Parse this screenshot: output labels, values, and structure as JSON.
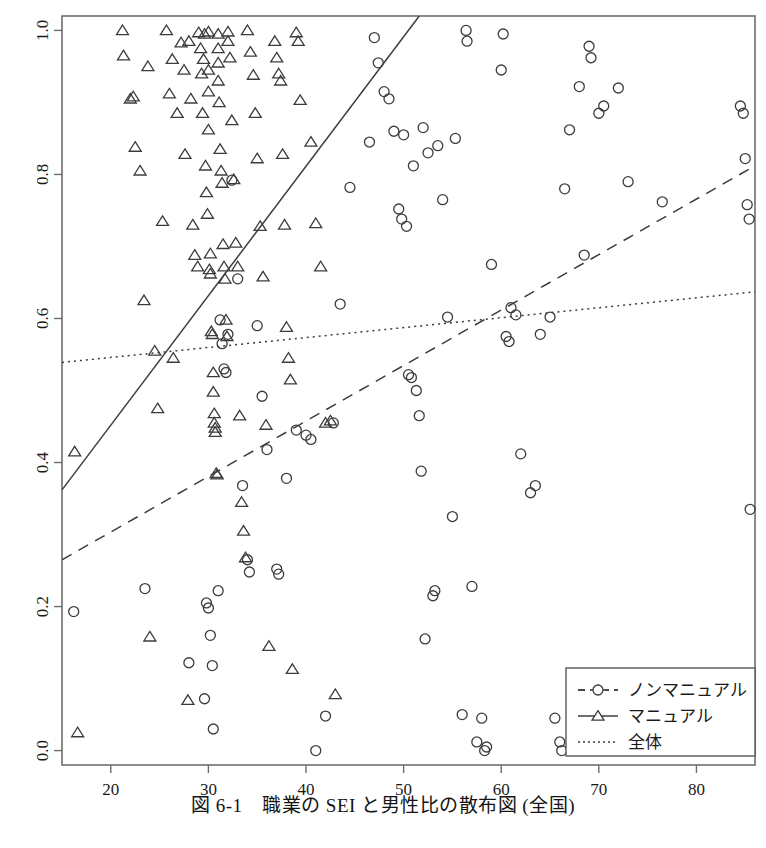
{
  "figure": {
    "caption": "図 6-1　職業の SEI と男性比の散布図 (全国)",
    "background": "#ffffff",
    "ink": "#1a1a1a"
  },
  "chart_data": {
    "type": "scatter",
    "title": "図 6-1　職業の SEI と男性比の散布図 (全国)",
    "xlabel": "",
    "ylabel": "",
    "xlim": [
      15.0,
      86.0
    ],
    "ylim": [
      -0.02,
      1.02
    ],
    "xticks": [
      20,
      30,
      40,
      50,
      60,
      70,
      80
    ],
    "xticklabels": [
      "20",
      "30",
      "40",
      "50",
      "60",
      "70",
      "80"
    ],
    "yticks": [
      0.0,
      0.2,
      0.4,
      0.6,
      0.8,
      1.0
    ],
    "yticklabels": [
      "0.0",
      "0.2",
      "0.4",
      "0.6",
      "0.8",
      "1.0"
    ],
    "grid": false,
    "legend_position": "bottom-right",
    "legend": [
      {
        "label": "ノンマニュアル",
        "marker": "circle",
        "line": "dashed"
      },
      {
        "label": "マニュアル",
        "marker": "triangle",
        "line": "solid"
      },
      {
        "label": "全体",
        "marker": "none",
        "line": "dotted"
      }
    ],
    "series": [
      {
        "name": "マニュアル",
        "marker": "triangle",
        "points": [
          [
            16.3,
            0.415
          ],
          [
            16.6,
            0.025
          ],
          [
            21.2,
            1.0
          ],
          [
            21.3,
            0.965
          ],
          [
            22.0,
            0.905
          ],
          [
            22.3,
            0.908
          ],
          [
            22.5,
            0.838
          ],
          [
            23.0,
            0.805
          ],
          [
            23.4,
            0.625
          ],
          [
            23.8,
            0.95
          ],
          [
            24.0,
            0.158
          ],
          [
            24.5,
            0.555
          ],
          [
            24.8,
            0.475
          ],
          [
            25.3,
            0.735
          ],
          [
            25.7,
            1.0
          ],
          [
            26.0,
            0.912
          ],
          [
            26.3,
            0.96
          ],
          [
            26.4,
            0.545
          ],
          [
            26.8,
            0.885
          ],
          [
            27.2,
            0.983
          ],
          [
            27.5,
            0.945
          ],
          [
            27.6,
            0.828
          ],
          [
            27.9,
            0.07
          ],
          [
            28.0,
            0.985
          ],
          [
            28.2,
            0.905
          ],
          [
            28.4,
            0.73
          ],
          [
            28.6,
            0.688
          ],
          [
            28.9,
            0.672
          ],
          [
            29.0,
            0.997
          ],
          [
            29.2,
            0.975
          ],
          [
            29.3,
            0.94
          ],
          [
            29.4,
            0.885
          ],
          [
            29.5,
            0.96
          ],
          [
            29.6,
            0.995
          ],
          [
            29.7,
            0.812
          ],
          [
            29.8,
            0.775
          ],
          [
            29.9,
            0.745
          ],
          [
            30.0,
            0.998
          ],
          [
            30.0,
            0.945
          ],
          [
            30.0,
            0.915
          ],
          [
            30.0,
            0.862
          ],
          [
            30.1,
            0.668
          ],
          [
            30.2,
            0.662
          ],
          [
            30.2,
            0.69
          ],
          [
            30.3,
            0.582
          ],
          [
            30.4,
            0.578
          ],
          [
            30.5,
            0.525
          ],
          [
            30.5,
            0.498
          ],
          [
            30.6,
            0.468
          ],
          [
            30.6,
            0.455
          ],
          [
            30.7,
            0.442
          ],
          [
            30.7,
            0.448
          ],
          [
            30.8,
            0.385
          ],
          [
            30.9,
            0.383
          ],
          [
            31.0,
            0.995
          ],
          [
            31.0,
            0.975
          ],
          [
            31.0,
            0.955
          ],
          [
            31.0,
            0.93
          ],
          [
            31.1,
            0.9
          ],
          [
            31.2,
            0.835
          ],
          [
            31.3,
            0.805
          ],
          [
            31.4,
            0.788
          ],
          [
            31.5,
            0.703
          ],
          [
            31.6,
            0.672
          ],
          [
            31.7,
            0.655
          ],
          [
            31.8,
            0.598
          ],
          [
            31.9,
            0.575
          ],
          [
            32.0,
            0.998
          ],
          [
            32.0,
            0.985
          ],
          [
            32.2,
            0.962
          ],
          [
            32.4,
            0.875
          ],
          [
            32.6,
            0.793
          ],
          [
            32.8,
            0.705
          ],
          [
            33.0,
            0.672
          ],
          [
            33.2,
            0.465
          ],
          [
            33.4,
            0.345
          ],
          [
            33.6,
            0.305
          ],
          [
            33.8,
            0.268
          ],
          [
            34.0,
            1.0
          ],
          [
            34.3,
            0.97
          ],
          [
            34.6,
            0.938
          ],
          [
            34.8,
            0.885
          ],
          [
            35.0,
            0.822
          ],
          [
            35.3,
            0.728
          ],
          [
            35.6,
            0.658
          ],
          [
            35.9,
            0.452
          ],
          [
            36.2,
            0.145
          ],
          [
            36.8,
            0.985
          ],
          [
            37.0,
            0.962
          ],
          [
            37.2,
            0.94
          ],
          [
            37.4,
            0.93
          ],
          [
            37.6,
            0.828
          ],
          [
            37.8,
            0.73
          ],
          [
            38.0,
            0.588
          ],
          [
            38.2,
            0.545
          ],
          [
            38.4,
            0.515
          ],
          [
            38.6,
            0.113
          ],
          [
            39.0,
            0.997
          ],
          [
            39.2,
            0.985
          ],
          [
            39.4,
            0.903
          ],
          [
            40.5,
            0.845
          ],
          [
            41.0,
            0.732
          ],
          [
            41.5,
            0.672
          ],
          [
            42.0,
            0.455
          ],
          [
            42.5,
            0.458
          ],
          [
            43.0,
            0.078
          ]
        ]
      },
      {
        "name": "ノンマニュアル",
        "marker": "circle",
        "points": [
          [
            16.2,
            0.193
          ],
          [
            23.5,
            0.225
          ],
          [
            28.0,
            0.122
          ],
          [
            29.6,
            0.072
          ],
          [
            29.8,
            0.205
          ],
          [
            30.0,
            0.198
          ],
          [
            30.2,
            0.16
          ],
          [
            30.4,
            0.118
          ],
          [
            30.5,
            0.03
          ],
          [
            31.0,
            0.222
          ],
          [
            31.2,
            0.598
          ],
          [
            31.4,
            0.565
          ],
          [
            31.6,
            0.53
          ],
          [
            31.8,
            0.525
          ],
          [
            32.0,
            0.578
          ],
          [
            32.4,
            0.792
          ],
          [
            33.0,
            0.655
          ],
          [
            33.5,
            0.368
          ],
          [
            34.0,
            0.265
          ],
          [
            34.2,
            0.248
          ],
          [
            35.0,
            0.59
          ],
          [
            35.5,
            0.492
          ],
          [
            36.0,
            0.418
          ],
          [
            37.0,
            0.252
          ],
          [
            37.2,
            0.245
          ],
          [
            38.0,
            0.378
          ],
          [
            39.0,
            0.445
          ],
          [
            40.0,
            0.438
          ],
          [
            40.5,
            0.432
          ],
          [
            41.0,
            0.0
          ],
          [
            42.0,
            0.048
          ],
          [
            42.8,
            0.455
          ],
          [
            43.5,
            0.62
          ],
          [
            44.5,
            0.782
          ],
          [
            46.5,
            0.845
          ],
          [
            47.0,
            0.99
          ],
          [
            47.4,
            0.955
          ],
          [
            48.0,
            0.915
          ],
          [
            48.5,
            0.905
          ],
          [
            49.0,
            0.86
          ],
          [
            49.5,
            0.752
          ],
          [
            49.8,
            0.738
          ],
          [
            50.0,
            0.855
          ],
          [
            50.3,
            0.728
          ],
          [
            50.5,
            0.522
          ],
          [
            50.8,
            0.518
          ],
          [
            51.0,
            0.812
          ],
          [
            51.3,
            0.5
          ],
          [
            51.6,
            0.465
          ],
          [
            51.8,
            0.388
          ],
          [
            52.0,
            0.865
          ],
          [
            52.2,
            0.155
          ],
          [
            52.5,
            0.83
          ],
          [
            53.0,
            0.215
          ],
          [
            53.2,
            0.222
          ],
          [
            53.5,
            0.84
          ],
          [
            54.0,
            0.765
          ],
          [
            54.5,
            0.602
          ],
          [
            55.0,
            0.325
          ],
          [
            55.3,
            0.85
          ],
          [
            56.0,
            0.05
          ],
          [
            56.4,
            1.0
          ],
          [
            56.5,
            0.985
          ],
          [
            57.0,
            0.228
          ],
          [
            57.5,
            0.012
          ],
          [
            58.0,
            0.045
          ],
          [
            58.3,
            0.0
          ],
          [
            58.5,
            0.005
          ],
          [
            59.0,
            0.675
          ],
          [
            60.0,
            0.945
          ],
          [
            60.2,
            0.995
          ],
          [
            60.5,
            0.575
          ],
          [
            60.8,
            0.568
          ],
          [
            61.0,
            0.615
          ],
          [
            61.5,
            0.605
          ],
          [
            62.0,
            0.412
          ],
          [
            63.0,
            0.358
          ],
          [
            63.5,
            0.368
          ],
          [
            64.0,
            0.578
          ],
          [
            65.0,
            0.602
          ],
          [
            65.5,
            0.045
          ],
          [
            66.0,
            0.012
          ],
          [
            66.2,
            0.0
          ],
          [
            66.5,
            0.78
          ],
          [
            67.0,
            0.862
          ],
          [
            68.0,
            0.922
          ],
          [
            68.5,
            0.688
          ],
          [
            69.0,
            0.978
          ],
          [
            69.2,
            0.962
          ],
          [
            70.0,
            0.885
          ],
          [
            70.5,
            0.895
          ],
          [
            72.0,
            0.92
          ],
          [
            73.0,
            0.79
          ],
          [
            76.5,
            0.762
          ],
          [
            84.5,
            0.895
          ],
          [
            84.8,
            0.885
          ],
          [
            85.0,
            0.822
          ],
          [
            85.2,
            0.758
          ],
          [
            85.4,
            0.738
          ],
          [
            85.5,
            0.335
          ]
        ]
      }
    ],
    "fit_lines": [
      {
        "name": "マニュアル",
        "style": "solid",
        "x0": 15.0,
        "y0": 0.362,
        "x1": 51.6,
        "y1": 1.02
      },
      {
        "name": "ノンマニュアル",
        "style": "dashed",
        "x0": 15.0,
        "y0": 0.265,
        "x1": 86.0,
        "y1": 0.812
      },
      {
        "name": "全体",
        "style": "dotted",
        "x0": 15.0,
        "y0": 0.539,
        "x1": 86.0,
        "y1": 0.637
      }
    ]
  }
}
